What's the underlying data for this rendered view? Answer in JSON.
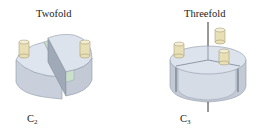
{
  "figure": {
    "panels": [
      {
        "title": "Twofold",
        "symbol_main": "C",
        "symbol_sub": "2",
        "segments": 2,
        "posts": 2
      },
      {
        "title": "Threefold",
        "symbol_main": "C",
        "symbol_sub": "3",
        "segments": 3,
        "posts": 3
      }
    ],
    "colors": {
      "body_light": "#dde3ec",
      "body_side": "#c3cad6",
      "body_dark": "#9ea8b8",
      "post": "#e8dfb4",
      "post_top": "#f3eed2",
      "accent_green": "#c9e0c9",
      "axis": "#333333"
    }
  }
}
